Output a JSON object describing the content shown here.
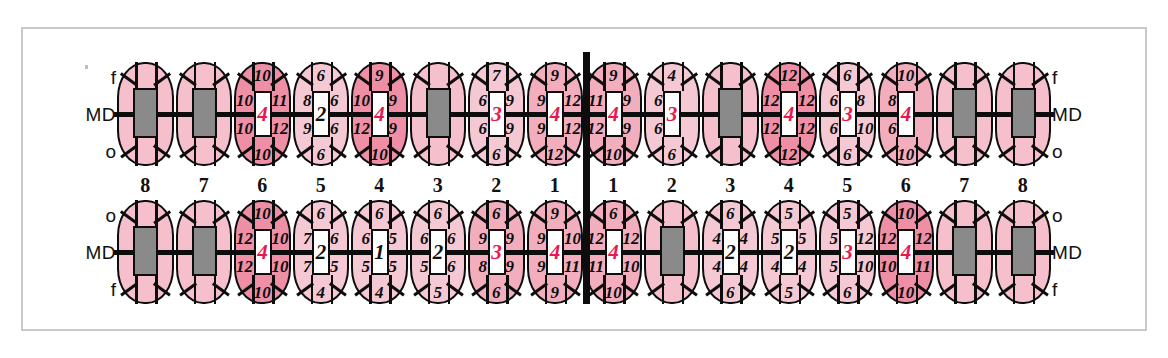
{
  "chart_data": {
    "type": "table",
    "legend": {
      "upper_left_labels": [
        "f",
        "MD",
        "o"
      ],
      "upper_right_labels": [
        "f",
        "MD",
        "o"
      ],
      "lower_left_labels": [
        "o",
        "MD",
        "f"
      ],
      "lower_right_labels": [
        "o",
        "MD",
        "f"
      ]
    },
    "tooth_numbers": [
      "8",
      "7",
      "6",
      "5",
      "4",
      "3",
      "2",
      "1",
      "1",
      "2",
      "3",
      "4",
      "5",
      "6",
      "7",
      "8"
    ],
    "colors": {
      "deep": "#ef8fa5",
      "mid": "#f3aebe",
      "light": "#f5c9d4",
      "missing": "#8a8a8a",
      "red_value": "#e8174e",
      "ink": "#0d0d0d"
    },
    "upper_arch": [
      {
        "num": "8",
        "state": "missing",
        "shade": "missing",
        "top": "",
        "bottom": "",
        "lt": "",
        "lb": "",
        "rt": "",
        "rb": "",
        "center": "",
        "center_red": false
      },
      {
        "num": "7",
        "state": "missing",
        "shade": "missing",
        "top": "",
        "bottom": "",
        "lt": "",
        "lb": "",
        "rt": "",
        "rb": "",
        "center": "",
        "center_red": false
      },
      {
        "num": "6",
        "state": "charted",
        "shade": "deep",
        "top": "10",
        "bottom": "10",
        "lt": "10",
        "lb": "10",
        "rt": "11",
        "rb": "12",
        "center": "4",
        "center_red": true
      },
      {
        "num": "5",
        "state": "charted",
        "shade": "light",
        "top": "6",
        "bottom": "6",
        "lt": "8",
        "lb": "9",
        "rt": "6",
        "rb": "6",
        "center": "2",
        "center_red": false
      },
      {
        "num": "4",
        "state": "charted",
        "shade": "deep",
        "top": "9",
        "bottom": "10",
        "lt": "10",
        "lb": "12",
        "rt": "9",
        "rb": "9",
        "center": "4",
        "center_red": true
      },
      {
        "num": "3",
        "state": "missing",
        "shade": "missing",
        "top": "",
        "bottom": "",
        "lt": "",
        "lb": "",
        "rt": "",
        "rb": "",
        "center": "",
        "center_red": false
      },
      {
        "num": "2",
        "state": "charted",
        "shade": "light",
        "top": "7",
        "bottom": "6",
        "lt": "6",
        "lb": "6",
        "rt": "9",
        "rb": "9",
        "center": "3",
        "center_red": true
      },
      {
        "num": "1",
        "state": "charted",
        "shade": "mid",
        "top": "9",
        "bottom": "12",
        "lt": "9",
        "lb": "9",
        "rt": "12",
        "rb": "12",
        "center": "4",
        "center_red": true
      },
      {
        "num": "1",
        "state": "charted",
        "shade": "mid",
        "top": "9",
        "bottom": "10",
        "lt": "11",
        "lb": "12",
        "rt": "9",
        "rb": "9",
        "center": "4",
        "center_red": true
      },
      {
        "num": "2",
        "state": "charted",
        "shade": "light",
        "top": "4",
        "bottom": "6",
        "lt": "6",
        "lb": "6",
        "rt": "",
        "rb": "",
        "center": "3",
        "center_red": true
      },
      {
        "num": "3",
        "state": "missing",
        "shade": "missing",
        "top": "",
        "bottom": "",
        "lt": "",
        "lb": "",
        "rt": "",
        "rb": "",
        "center": "",
        "center_red": false
      },
      {
        "num": "4",
        "state": "charted",
        "shade": "deep",
        "top": "12",
        "bottom": "12",
        "lt": "12",
        "lb": "12",
        "rt": "12",
        "rb": "12",
        "center": "4",
        "center_red": true
      },
      {
        "num": "5",
        "state": "charted",
        "shade": "light",
        "top": "6",
        "bottom": "6",
        "lt": "6",
        "lb": "6",
        "rt": "8",
        "rb": "10",
        "center": "3",
        "center_red": true
      },
      {
        "num": "6",
        "state": "charted",
        "shade": "mid",
        "top": "10",
        "bottom": "10",
        "lt": "8",
        "lb": "6",
        "rt": "",
        "rb": "",
        "center": "4",
        "center_red": true
      },
      {
        "num": "7",
        "state": "missing",
        "shade": "missing",
        "top": "",
        "bottom": "",
        "lt": "",
        "lb": "",
        "rt": "",
        "rb": "",
        "center": "",
        "center_red": false
      },
      {
        "num": "8",
        "state": "missing",
        "shade": "missing",
        "top": "",
        "bottom": "",
        "lt": "",
        "lb": "",
        "rt": "",
        "rb": "",
        "center": "",
        "center_red": false
      }
    ],
    "lower_arch": [
      {
        "num": "8",
        "state": "missing",
        "shade": "missing",
        "top": "",
        "bottom": "",
        "lt": "",
        "lb": "",
        "rt": "",
        "rb": "",
        "center": "",
        "center_red": false
      },
      {
        "num": "7",
        "state": "missing",
        "shade": "missing",
        "top": "",
        "bottom": "",
        "lt": "",
        "lb": "",
        "rt": "",
        "rb": "",
        "center": "",
        "center_red": false
      },
      {
        "num": "6",
        "state": "charted",
        "shade": "deep",
        "top": "10",
        "bottom": "10",
        "lt": "12",
        "lb": "12",
        "rt": "10",
        "rb": "10",
        "center": "4",
        "center_red": true
      },
      {
        "num": "5",
        "state": "charted",
        "shade": "light",
        "top": "6",
        "bottom": "4",
        "lt": "7",
        "lb": "7",
        "rt": "6",
        "rb": "5",
        "center": "2",
        "center_red": false
      },
      {
        "num": "4",
        "state": "charted",
        "shade": "light",
        "top": "6",
        "bottom": "4",
        "lt": "6",
        "lb": "5",
        "rt": "5",
        "rb": "5",
        "center": "1",
        "center_red": false
      },
      {
        "num": "3",
        "state": "charted",
        "shade": "light",
        "top": "6",
        "bottom": "5",
        "lt": "6",
        "lb": "5",
        "rt": "6",
        "rb": "6",
        "center": "2",
        "center_red": false
      },
      {
        "num": "2",
        "state": "charted",
        "shade": "mid",
        "top": "6",
        "bottom": "6",
        "lt": "9",
        "lb": "8",
        "rt": "9",
        "rb": "9",
        "center": "3",
        "center_red": true
      },
      {
        "num": "1",
        "state": "charted",
        "shade": "mid",
        "top": "9",
        "bottom": "9",
        "lt": "9",
        "lb": "9",
        "rt": "10",
        "rb": "11",
        "center": "4",
        "center_red": true
      },
      {
        "num": "1",
        "state": "charted",
        "shade": "mid",
        "top": "6",
        "bottom": "10",
        "lt": "12",
        "lb": "11",
        "rt": "12",
        "rb": "10",
        "center": "4",
        "center_red": true
      },
      {
        "num": "2",
        "state": "missing",
        "shade": "missing",
        "top": "",
        "bottom": "",
        "lt": "",
        "lb": "",
        "rt": "",
        "rb": "",
        "center": "",
        "center_red": false
      },
      {
        "num": "3",
        "state": "charted",
        "shade": "light",
        "top": "6",
        "bottom": "6",
        "lt": "4",
        "lb": "4",
        "rt": "4",
        "rb": "4",
        "center": "2",
        "center_red": false
      },
      {
        "num": "4",
        "state": "charted",
        "shade": "light",
        "top": "5",
        "bottom": "5",
        "lt": "5",
        "lb": "4",
        "rt": "5",
        "rb": "4",
        "center": "2",
        "center_red": false
      },
      {
        "num": "5",
        "state": "charted",
        "shade": "light",
        "top": "5",
        "bottom": "6",
        "lt": "5",
        "lb": "5",
        "rt": "12",
        "rb": "10",
        "center": "3",
        "center_red": true
      },
      {
        "num": "6",
        "state": "charted",
        "shade": "deep",
        "top": "10",
        "bottom": "10",
        "lt": "12",
        "lb": "10",
        "rt": "12",
        "rb": "11",
        "center": "4",
        "center_red": true
      },
      {
        "num": "7",
        "state": "missing",
        "shade": "missing",
        "top": "",
        "bottom": "",
        "lt": "",
        "lb": "",
        "rt": "",
        "rb": "",
        "center": "",
        "center_red": false
      },
      {
        "num": "8",
        "state": "missing",
        "shade": "missing",
        "top": "",
        "bottom": "",
        "lt": "",
        "lb": "",
        "rt": "",
        "rb": "",
        "center": "",
        "center_red": false
      }
    ]
  }
}
